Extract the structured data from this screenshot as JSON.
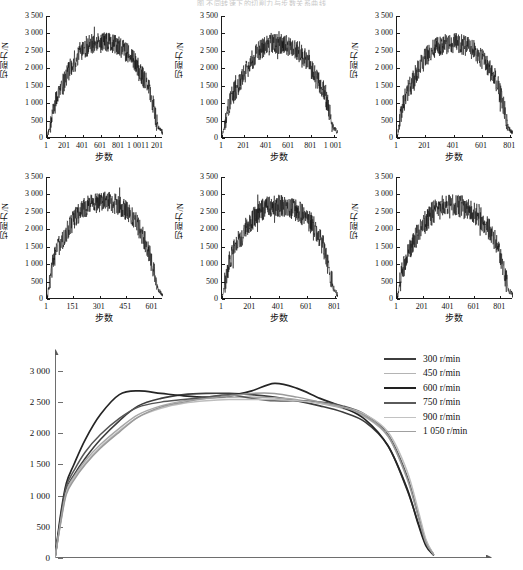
{
  "caption_top": "图 不同转速下的切削力与步数关系曲线",
  "axis": {
    "ylabel": "切削力/N",
    "xlabel": "步数",
    "yticks": [
      "0",
      "500",
      "1 000",
      "1 500",
      "2 000",
      "2 500",
      "3 000",
      "3 500"
    ],
    "yvalues": [
      0,
      500,
      1000,
      1500,
      2000,
      2500,
      3000,
      3500
    ]
  },
  "chart_data": [
    {
      "type": "line",
      "title": "",
      "speed": "300 r/min",
      "xlabel": "步数",
      "ylabel": "切削力/N",
      "xticks": [
        "1",
        "201",
        "401",
        "601",
        "801",
        "1 001",
        "1 201"
      ],
      "xtickvalues": [
        1,
        201,
        401,
        601,
        801,
        1001,
        1201
      ],
      "yticks": [
        "0",
        "500",
        "1 000",
        "1 500",
        "2 000",
        "2 500",
        "3 000",
        "3 500"
      ],
      "xlim": [
        1,
        1290
      ],
      "ylim": [
        0,
        3500
      ],
      "grid": false,
      "noise": 300,
      "seed": 11,
      "peak": 2750,
      "profile": [
        0,
        560,
        1150,
        1450,
        1750,
        2050,
        2300,
        2500,
        2620,
        2680,
        2700,
        2720,
        2740,
        2760,
        2700,
        2620,
        2500,
        2380,
        2200,
        1980,
        1700,
        1450,
        900,
        300,
        150
      ]
    },
    {
      "type": "line",
      "title": "",
      "speed": "450 r/min",
      "xlabel": "步数",
      "ylabel": "切削力/N",
      "xticks": [
        "1",
        "201",
        "401",
        "601",
        "801",
        "1 001"
      ],
      "xtickvalues": [
        1,
        201,
        401,
        601,
        801,
        1001
      ],
      "yticks": [
        "0",
        "500",
        "1 000",
        "1 500",
        "2 000",
        "2 500",
        "3 000",
        "3 500"
      ],
      "xlim": [
        1,
        1040
      ],
      "ylim": [
        0,
        3500
      ],
      "grid": false,
      "noise": 310,
      "seed": 23,
      "peak": 2700,
      "profile": [
        0,
        700,
        1200,
        1420,
        1700,
        1950,
        2200,
        2420,
        2560,
        2640,
        2680,
        2700,
        2700,
        2680,
        2640,
        2580,
        2480,
        2360,
        2100,
        1820,
        1600,
        1400,
        900,
        320,
        130
      ]
    },
    {
      "type": "line",
      "title": "",
      "speed": "600 r/min",
      "xlabel": "步数",
      "ylabel": "切削力/N",
      "xticks": [
        "1",
        "201",
        "401",
        "601",
        "801"
      ],
      "xtickvalues": [
        1,
        201,
        401,
        601,
        801
      ],
      "yticks": [
        "0",
        "500",
        "1 000",
        "1 500",
        "2 000",
        "2 500",
        "3 000",
        "3 500"
      ],
      "xlim": [
        1,
        820
      ],
      "ylim": [
        0,
        3500
      ],
      "grid": false,
      "noise": 300,
      "seed": 37,
      "peak": 2750,
      "profile": [
        0,
        820,
        1300,
        1560,
        1850,
        2100,
        2330,
        2500,
        2600,
        2660,
        2700,
        2720,
        2720,
        2700,
        2660,
        2600,
        2500,
        2380,
        2200,
        2000,
        1800,
        1500,
        950,
        300,
        120
      ]
    },
    {
      "type": "line",
      "title": "",
      "speed": "750 r/min",
      "xlabel": "步数",
      "ylabel": "切削力/N",
      "xticks": [
        "1",
        "151",
        "301",
        "451",
        "601"
      ],
      "xtickvalues": [
        1,
        151,
        301,
        451,
        601
      ],
      "yticks": [
        "0",
        "500",
        "1 000",
        "1 500",
        "2 000",
        "2 500",
        "3 000",
        "3 500"
      ],
      "xlim": [
        1,
        660
      ],
      "ylim": [
        0,
        3500
      ],
      "grid": false,
      "noise": 300,
      "seed": 51,
      "peak": 2800,
      "profile": [
        0,
        900,
        1400,
        1650,
        1900,
        2150,
        2350,
        2520,
        2640,
        2720,
        2760,
        2780,
        2790,
        2780,
        2740,
        2680,
        2600,
        2480,
        2300,
        2050,
        1750,
        1400,
        850,
        260,
        80
      ]
    },
    {
      "type": "line",
      "title": "",
      "speed": "900 r/min",
      "xlabel": "步数",
      "ylabel": "切削力/N",
      "xticks": [
        "1",
        "201",
        "401",
        "601",
        "801"
      ],
      "xtickvalues": [
        1,
        201,
        401,
        601,
        801
      ],
      "yticks": [
        "0",
        "500",
        "1 000",
        "1 500",
        "2 000",
        "2 500",
        "3 000",
        "3 500"
      ],
      "xlim": [
        1,
        820
      ],
      "ylim": [
        0,
        3500
      ],
      "grid": false,
      "noise": 330,
      "seed": 67,
      "peak": 2700,
      "profile": [
        0,
        780,
        1280,
        1520,
        1800,
        2050,
        2250,
        2420,
        2540,
        2600,
        2640,
        2660,
        2660,
        2640,
        2600,
        2550,
        2480,
        2380,
        2240,
        2050,
        1800,
        1500,
        950,
        300,
        110
      ]
    },
    {
      "type": "line",
      "title": "",
      "speed": "1 050 r/min",
      "xlabel": "步数",
      "ylabel": "切削力/N",
      "xticks": [
        "1",
        "201",
        "401",
        "601",
        "801"
      ],
      "xtickvalues": [
        1,
        201,
        401,
        601,
        801
      ],
      "yticks": [
        "0",
        "500",
        "1 000",
        "1 500",
        "2 000",
        "2 500",
        "3 000",
        "3 500"
      ],
      "xlim": [
        1,
        900
      ],
      "ylim": [
        0,
        3500
      ],
      "grid": false,
      "noise": 340,
      "seed": 83,
      "peak": 2750,
      "profile": [
        0,
        700,
        1250,
        1500,
        1780,
        2020,
        2250,
        2420,
        2540,
        2620,
        2660,
        2680,
        2680,
        2660,
        2620,
        2560,
        2480,
        2380,
        2220,
        2000,
        1780,
        1450,
        900,
        280,
        100
      ]
    }
  ],
  "summary_chart": {
    "type": "line",
    "title": "",
    "xlabel": "",
    "ylabel": "",
    "yticks": [
      "0",
      "500",
      "1 000",
      "1 500",
      "2 000",
      "2 500",
      "3 000"
    ],
    "ytickvalues": [
      0,
      500,
      1000,
      1500,
      2000,
      2500,
      3000
    ],
    "ylim": [
      0,
      3400
    ],
    "xlim": [
      0,
      100
    ],
    "grid": false,
    "legend_position": "right",
    "series": [
      {
        "name": "300 r/min",
        "color": "#3d3d3d",
        "width": 1.6,
        "x": [
          0,
          1.5,
          3,
          5,
          8,
          12,
          17,
          22,
          28,
          34,
          40,
          46,
          52,
          58,
          64,
          70,
          76,
          82,
          88,
          93,
          96,
          98,
          100
        ],
        "values": [
          0,
          620,
          1100,
          1330,
          1600,
          1900,
          2200,
          2440,
          2560,
          2620,
          2640,
          2640,
          2620,
          2580,
          2520,
          2440,
          2340,
          2180,
          1800,
          1100,
          560,
          220,
          60
        ]
      },
      {
        "name": "450 r/min",
        "color": "#a8a8a8",
        "width": 1.5,
        "x": [
          0,
          1.5,
          3,
          5,
          8,
          12,
          17,
          22,
          28,
          34,
          40,
          46,
          52,
          58,
          64,
          70,
          76,
          82,
          88,
          93,
          96,
          98,
          100
        ],
        "values": [
          0,
          600,
          1080,
          1300,
          1560,
          1820,
          2080,
          2300,
          2440,
          2520,
          2560,
          2580,
          2580,
          2570,
          2540,
          2480,
          2400,
          2260,
          1950,
          1300,
          700,
          280,
          60
        ]
      },
      {
        "name": "600 r/min",
        "color": "#252525",
        "width": 1.7,
        "x": [
          0,
          1.5,
          3,
          5,
          8,
          12,
          17,
          22,
          28,
          34,
          40,
          46,
          52,
          58,
          64,
          70,
          76,
          82,
          88,
          93,
          96,
          98,
          100
        ],
        "values": [
          0,
          700,
          1200,
          1500,
          1900,
          2300,
          2620,
          2680,
          2640,
          2600,
          2580,
          2600,
          2680,
          2800,
          2720,
          2560,
          2420,
          2220,
          1800,
          1120,
          540,
          200,
          50
        ]
      },
      {
        "name": "750 r/min",
        "color": "#555555",
        "width": 1.5,
        "x": [
          0,
          1.5,
          3,
          5,
          8,
          12,
          17,
          22,
          28,
          34,
          40,
          46,
          52,
          58,
          64,
          70,
          76,
          82,
          88,
          93,
          96,
          98,
          100
        ],
        "values": [
          0,
          650,
          1150,
          1400,
          1700,
          1980,
          2240,
          2420,
          2500,
          2540,
          2580,
          2620,
          2560,
          2520,
          2520,
          2500,
          2440,
          2300,
          1980,
          1320,
          680,
          260,
          60
        ]
      },
      {
        "name": "900 r/min",
        "color": "#bdbdbd",
        "width": 1.5,
        "x": [
          0,
          1.5,
          3,
          5,
          8,
          12,
          17,
          22,
          28,
          34,
          40,
          46,
          52,
          58,
          64,
          70,
          76,
          82,
          88,
          93,
          96,
          98,
          100
        ],
        "values": [
          0,
          580,
          1050,
          1280,
          1520,
          1780,
          2040,
          2260,
          2400,
          2480,
          2520,
          2540,
          2540,
          2540,
          2520,
          2480,
          2420,
          2300,
          2020,
          1400,
          760,
          300,
          60
        ]
      },
      {
        "name": "1 050 r/min",
        "color": "#9a9a9a",
        "width": 1.5,
        "x": [
          0,
          1.5,
          3,
          5,
          8,
          12,
          17,
          22,
          28,
          34,
          40,
          46,
          52,
          58,
          64,
          70,
          76,
          82,
          88,
          93,
          96,
          98,
          100
        ],
        "values": [
          0,
          560,
          1020,
          1250,
          1500,
          1760,
          2020,
          2260,
          2420,
          2500,
          2560,
          2600,
          2640,
          2640,
          2580,
          2500,
          2420,
          2280,
          1960,
          1280,
          660,
          250,
          60
        ]
      }
    ]
  },
  "legend": {
    "items": [
      {
        "label": "300 r/min",
        "color": "#3d3d3d",
        "width": 2.2
      },
      {
        "label": "450 r/min",
        "color": "#b4b4b4",
        "width": 1.4
      },
      {
        "label": "600 r/min",
        "color": "#222222",
        "width": 2.4
      },
      {
        "label": "750 r/min",
        "color": "#5a5a5a",
        "width": 2.0
      },
      {
        "label": "900 r/min",
        "color": "#c2c2c2",
        "width": 1.4
      },
      {
        "label": "1 050 r/min",
        "color": "#a0a0a0",
        "width": 1.4
      }
    ]
  }
}
